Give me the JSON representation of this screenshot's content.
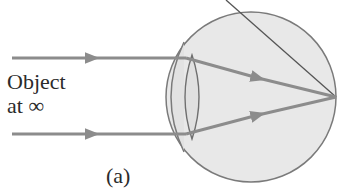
{
  "figure": {
    "label": "(a)",
    "object_label_line1": "Object",
    "object_label_line2": "at ∞"
  },
  "colors": {
    "eye_fill": "#e6e6e6",
    "eye_stroke": "#7a7a7a",
    "ray": "#8c8c8c",
    "lens_stroke": "#6f6f6f",
    "diagonal": "#555555",
    "text": "#2b2b2b"
  },
  "elements": {
    "eyeball": "circle",
    "lens": "biconvex lens",
    "rays": [
      "top parallel ray",
      "bottom parallel ray"
    ],
    "focal_point": "on retina",
    "leader_line": "diagonal line to focal point"
  }
}
